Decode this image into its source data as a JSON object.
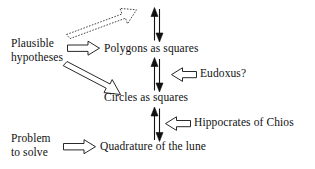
{
  "diagram": {
    "background": "#ffffff",
    "stroke": "#111111",
    "fill": "#ffffff",
    "nodes": {
      "plausible_line1": "Plausible",
      "plausible_line2": "hypotheses",
      "polygons": "Polygons as squares",
      "circles": "Circles as squares",
      "eudoxus": "Eudoxus?",
      "hippocrates": "Hippocrates of Chios",
      "problem_line1": "Problem",
      "problem_line2": "to solve",
      "quadrature": "Quadrature of the lune"
    },
    "connectors": {
      "dashed_diagonal_up": "dashed hollow arrow pointing up-right from hypotheses area toward top",
      "hypotheses_to_polygons": "hollow right arrow",
      "hypotheses_to_circles": "hollow diagonal arrow pointing down-right",
      "polygons_circles_double": "thin double arrow pair (up and down) between Polygons as squares and Circles as squares",
      "circles_quadrature_double": "thin double arrow pair (up and down) between Circles as squares and Quadrature of the lune",
      "eudoxus_to_link": "hollow left arrow",
      "hippocrates_to_link": "hollow left arrow",
      "problem_to_quadrature": "hollow right arrow"
    }
  }
}
